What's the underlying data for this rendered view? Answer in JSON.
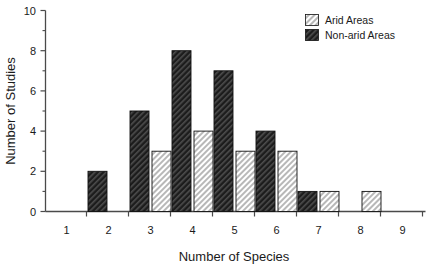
{
  "chart_data": {
    "type": "bar",
    "title": "",
    "xlabel": "Number of Species",
    "ylabel": "Number of Studies",
    "categories": [
      "1",
      "2",
      "3",
      "4",
      "5",
      "6",
      "7",
      "8",
      "9"
    ],
    "xlim": [
      0.5,
      9.5
    ],
    "ylim": [
      0,
      10
    ],
    "y_major_ticks": [
      "0",
      "2",
      "4",
      "6",
      "8",
      "10"
    ],
    "y_minor_ticks": [
      "1",
      "3",
      "5",
      "7",
      "9"
    ],
    "grid": false,
    "legend_position": "top-right",
    "series": [
      {
        "name": "Arid Areas",
        "fill_style": "light-diagonal-hatch",
        "color": "#d9d9d9",
        "values": [
          0,
          0,
          3,
          4,
          3,
          3,
          1,
          1,
          0
        ]
      },
      {
        "name": "Non-arid Areas",
        "fill_style": "dark-diagonal-hatch",
        "color": "#2b2b2b",
        "values": [
          2,
          5,
          8,
          7,
          4,
          1,
          0,
          0,
          0
        ]
      }
    ]
  },
  "axes": {
    "x_title": "Number of Species",
    "y_title": "Number of Studies",
    "x_tick_labels": [
      "1",
      "2",
      "3",
      "4",
      "5",
      "6",
      "7",
      "8",
      "9"
    ],
    "y_tick_labels": [
      "0",
      "2",
      "4",
      "6",
      "8",
      "10"
    ]
  },
  "legend": {
    "items": [
      {
        "label": "Arid Areas",
        "swatch": "light-hatch-swatch"
      },
      {
        "label": "Non-arid Areas",
        "swatch": "dark-hatch-swatch"
      }
    ]
  }
}
